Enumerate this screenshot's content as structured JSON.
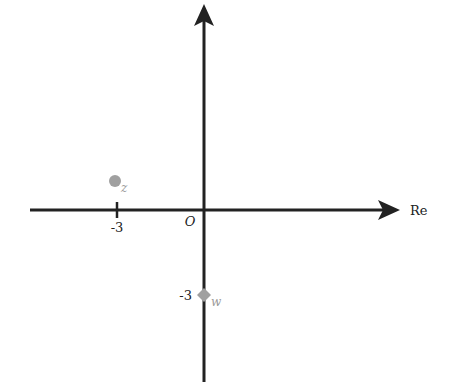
{
  "diagram": {
    "type": "complex-plane",
    "axes": {
      "horizontal_label": "Re",
      "origin_label": "O"
    },
    "ticks": {
      "x_tick_label": "-3",
      "y_tick_label": "-3"
    },
    "points": [
      {
        "name": "z",
        "label": "z",
        "re": -3,
        "im": 1,
        "shape": "circle",
        "color": "#a0a0a0"
      },
      {
        "name": "w",
        "label": "w",
        "re": 0,
        "im": -3,
        "shape": "diamond",
        "color": "#a0a0a0"
      }
    ]
  }
}
